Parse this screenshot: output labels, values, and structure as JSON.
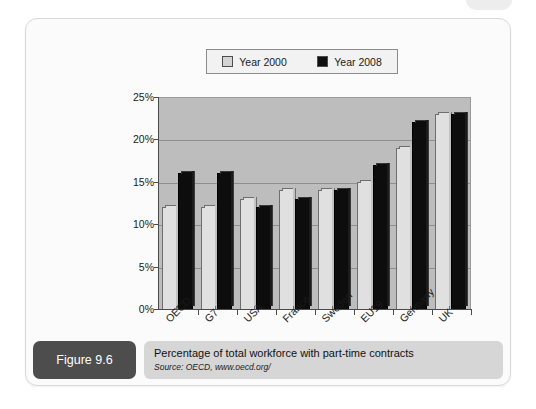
{
  "figure": {
    "tag": "Figure 9.6",
    "caption_title": "Percentage of total workforce with part-time contracts",
    "caption_source": "Source: OECD, www.oecd.org/"
  },
  "chart_data": {
    "type": "bar",
    "title": "Percentage of total workforce with part-time contracts",
    "xlabel": "",
    "ylabel": "",
    "ylim": [
      0,
      25
    ],
    "ytick_labels": [
      "0%",
      "5%",
      "10%",
      "15%",
      "20%",
      "25%"
    ],
    "ytick_values": [
      0,
      5,
      10,
      15,
      20,
      25
    ],
    "grid": true,
    "legend_position": "top",
    "categories": [
      "OECD",
      "G7",
      "USA",
      "France",
      "Sweden",
      "EU19",
      "Germany",
      "UK"
    ],
    "series": [
      {
        "name": "Year 2000",
        "color": "#e0e0e0",
        "values": [
          12,
          12,
          13,
          14,
          14,
          15,
          19,
          23
        ]
      },
      {
        "name": "Year 2008",
        "color": "#0d0d0d",
        "values": [
          16,
          16,
          12,
          13,
          14,
          17,
          22,
          23
        ]
      }
    ]
  }
}
